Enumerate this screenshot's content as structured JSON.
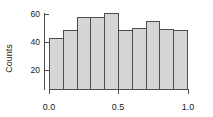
{
  "chart_data": {
    "type": "bar",
    "title": "",
    "subtitle": "",
    "xlabel": "",
    "ylabel": "Counts",
    "xlim": [
      0.0,
      1.0
    ],
    "ylim": [
      0,
      62
    ],
    "grid": false,
    "legend": null,
    "bin_width": 0.1,
    "bin_edges": [
      0.0,
      0.1,
      0.2,
      0.3,
      0.4,
      0.5,
      0.6,
      0.7,
      0.8,
      0.9,
      1.0
    ],
    "categories": [
      "0.0-0.1",
      "0.1-0.2",
      "0.2-0.3",
      "0.3-0.4",
      "0.4-0.5",
      "0.5-0.6",
      "0.6-0.7",
      "0.7-0.8",
      "0.8-0.9",
      "0.9-1.0"
    ],
    "values": [
      39,
      45,
      55,
      55,
      58,
      45,
      47,
      52,
      46,
      45
    ],
    "ytick_labels": [
      "60",
      "40",
      "20"
    ],
    "ytick_values": [
      60,
      40,
      20
    ],
    "xtick_labels": [
      "0.0",
      "0.5",
      "1.0"
    ],
    "xtick_values": [
      0.0,
      0.5,
      1.0
    ],
    "bar_fill_color": "#d6d6d6",
    "bar_edge_color": "#4d4d4d",
    "axis_color": "#4d4d4d",
    "text_color": "#1a1a1a",
    "background_color": "#ffffff"
  }
}
